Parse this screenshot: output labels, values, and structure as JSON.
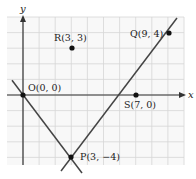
{
  "figure": {
    "type": "coordinate-plane",
    "axes": {
      "x_label": "x",
      "y_label": "y",
      "x_range": [
        -1,
        10
      ],
      "y_range": [
        -5,
        5
      ],
      "grid": true
    },
    "points": [
      {
        "name": "O",
        "label": "O(0, 0)",
        "x": 0,
        "y": 0
      },
      {
        "name": "R",
        "label": "R(3, 3)",
        "x": 3,
        "y": 3
      },
      {
        "name": "Q",
        "label": "Q(9, 4)",
        "x": 9,
        "y": 4
      },
      {
        "name": "S",
        "label": "S(7, 0)",
        "x": 7,
        "y": 0
      },
      {
        "name": "P",
        "label": "P(3, −4)",
        "x": 3,
        "y": -4
      }
    ],
    "lines": [
      {
        "name": "line-OP",
        "through": [
          "O",
          "P"
        ]
      },
      {
        "name": "line-PQ",
        "through": [
          "P",
          "Q"
        ]
      }
    ],
    "colors": {
      "grid": "#d8d8d8",
      "axis": "#333333",
      "line": "#444444",
      "point": "#111111",
      "background": "#ffffff",
      "grid_bg": "#f7f7f7"
    }
  }
}
